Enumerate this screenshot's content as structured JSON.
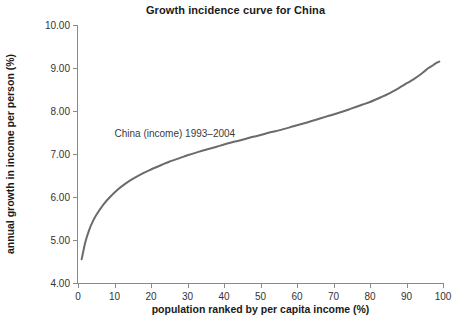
{
  "chart_data": {
    "type": "line",
    "title": "Growth incidence curve for China",
    "xlabel": "population ranked by per capita income (%)",
    "ylabel": "annual growth in income per person (%)",
    "xlim": [
      0,
      100
    ],
    "ylim": [
      4.0,
      10.0
    ],
    "grid": false,
    "legend": "none",
    "annotations": [
      {
        "text": "China (income) 1993–2004",
        "x": 10,
        "y": 7.45
      }
    ],
    "xticks": [
      0,
      10,
      20,
      30,
      40,
      50,
      60,
      70,
      80,
      90,
      100
    ],
    "xtick_labels": [
      "0",
      "10",
      "20",
      "30",
      "40",
      "50",
      "60",
      "70",
      "80",
      "90",
      "100"
    ],
    "yticks": [
      4.0,
      5.0,
      6.0,
      7.0,
      8.0,
      9.0,
      10.0
    ],
    "ytick_labels": [
      "4.00",
      "5.00",
      "6.00",
      "7.00",
      "8.00",
      "9.00",
      "10.00"
    ],
    "series": [
      {
        "name": "China (income) 1993–2004",
        "color": "#6b6b6b",
        "linewidth": 2,
        "x": [
          1,
          2,
          3,
          4,
          5,
          7,
          9,
          11,
          13,
          15,
          18,
          20,
          23,
          25,
          28,
          30,
          33,
          35,
          38,
          40,
          43,
          45,
          48,
          50,
          53,
          55,
          58,
          60,
          63,
          65,
          68,
          70,
          73,
          75,
          78,
          80,
          83,
          85,
          88,
          90,
          92,
          94,
          95,
          96,
          97,
          98,
          99
        ],
        "y": [
          4.55,
          4.95,
          5.22,
          5.42,
          5.58,
          5.83,
          6.02,
          6.18,
          6.31,
          6.42,
          6.56,
          6.64,
          6.75,
          6.82,
          6.91,
          6.97,
          7.05,
          7.1,
          7.17,
          7.22,
          7.29,
          7.33,
          7.4,
          7.44,
          7.51,
          7.55,
          7.62,
          7.67,
          7.74,
          7.79,
          7.87,
          7.92,
          8.0,
          8.06,
          8.15,
          8.21,
          8.32,
          8.4,
          8.54,
          8.64,
          8.74,
          8.86,
          8.93,
          9.0,
          9.05,
          9.11,
          9.15
        ]
      }
    ]
  }
}
